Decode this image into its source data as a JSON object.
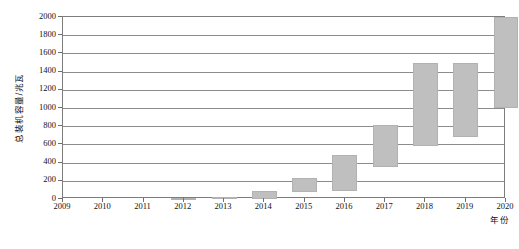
{
  "chart_data": {
    "type": "bar",
    "subtype": "waterfall",
    "title": "",
    "xlabel": "年份",
    "ylabel": "总装机容量/兆瓦",
    "categories": [
      "2009",
      "2010",
      "2011",
      "2012",
      "2013",
      "2014",
      "2015",
      "2016",
      "2017",
      "2018",
      "2019",
      "2020"
    ],
    "x_tick_labels": [
      "2009",
      "2010",
      "2011",
      "2012",
      "2013",
      "2014",
      "2015",
      "2016",
      "2017",
      "2018",
      "2019",
      "2020"
    ],
    "y_tick_labels": [
      "2000",
      "1800",
      "1600",
      "1400",
      "1200",
      "1000",
      "800",
      "600",
      "400",
      "200",
      "0"
    ],
    "y_tick_values": [
      2000,
      1800,
      1600,
      1400,
      1200,
      1000,
      800,
      600,
      400,
      200,
      0
    ],
    "ylim": [
      0,
      2000
    ],
    "y_major_step": 200,
    "grid": true,
    "grid_axis": "y",
    "legend": "none",
    "bar_color": "#bfbfbf",
    "axis_color": "#7d7d7d",
    "values": [
      0,
      0,
      0,
      10,
      25,
      85,
      230,
      480,
      810,
      1490,
      1490,
      2000
    ],
    "series": [
      {
        "name": "总装机容量",
        "bars": [
          {
            "category": "2009",
            "start": 0,
            "end": 0
          },
          {
            "category": "2010",
            "start": 0,
            "end": 0
          },
          {
            "category": "2011",
            "start": 0,
            "end": 0
          },
          {
            "category": "2012",
            "start": 0,
            "end": 10
          },
          {
            "category": "2013",
            "start": 0,
            "end": 25
          },
          {
            "category": "2014",
            "start": 0,
            "end": 85
          },
          {
            "category": "2015",
            "start": 75,
            "end": 230
          },
          {
            "category": "2016",
            "start": 85,
            "end": 480
          },
          {
            "category": "2017",
            "start": 355,
            "end": 810
          },
          {
            "category": "2018",
            "start": 580,
            "end": 1490
          },
          {
            "category": "2019",
            "start": 685,
            "end": 1490
          },
          {
            "category": "2020",
            "start": 1000,
            "end": 2000
          }
        ]
      }
    ]
  },
  "axes": {
    "y_title": "总装机容量/兆瓦",
    "x_title": "年份"
  },
  "watermark": {
    "text": ""
  },
  "caption": {
    "text": ""
  }
}
